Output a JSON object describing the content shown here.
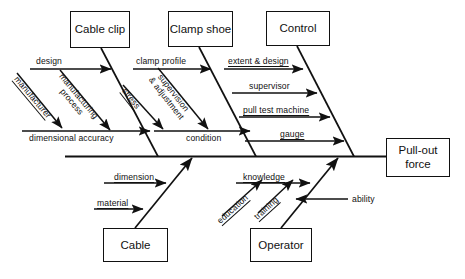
{
  "diagram": {
    "type": "fishbone-ishikawa",
    "title": "",
    "effect": {
      "label_line1": "Pull-out",
      "label_line2": "force",
      "full_label": "Pull-out force"
    },
    "categories": [
      {
        "name": "Cable clip",
        "position": "top",
        "causes": [
          {
            "label": "design",
            "orientation": "horizontal",
            "underlined": false
          },
          {
            "label": "manufacturer",
            "orientation": "diagonal",
            "underlined": true
          },
          {
            "label": "manufacturing",
            "label2": "process",
            "orientation": "diagonal",
            "underlined": true
          },
          {
            "label": "dimensional accuracy",
            "orientation": "horizontal",
            "underlined": false
          }
        ]
      },
      {
        "name": "Clamp shoe",
        "position": "top",
        "causes": [
          {
            "label": "clamp profile",
            "orientation": "horizontal",
            "underlined": false
          },
          {
            "label": "supervision",
            "label2": "& adjustment",
            "orientation": "diagonal",
            "underlined": true
          },
          {
            "label": "stress",
            "orientation": "diagonal",
            "underlined": true
          },
          {
            "label": "condition",
            "orientation": "horizontal",
            "underlined": false
          }
        ]
      },
      {
        "name": "Control",
        "position": "top",
        "causes": [
          {
            "label": "extent & design",
            "orientation": "horizontal",
            "underlined": true
          },
          {
            "label": "supervisor",
            "orientation": "horizontal",
            "underlined": false
          },
          {
            "label": "pull test machine",
            "orientation": "horizontal",
            "underlined": true
          },
          {
            "label": "gauge",
            "orientation": "horizontal",
            "underlined": true
          }
        ]
      },
      {
        "name": "Cable",
        "position": "bottom",
        "causes": [
          {
            "label": "dimension",
            "orientation": "horizontal",
            "underlined": true
          },
          {
            "label": "material",
            "orientation": "horizontal",
            "underlined": true
          }
        ]
      },
      {
        "name": "Operator",
        "position": "bottom",
        "causes": [
          {
            "label": "knowledge",
            "orientation": "horizontal",
            "underlined": true
          },
          {
            "label": "education",
            "orientation": "diagonal",
            "underlined": true
          },
          {
            "label": "training",
            "orientation": "diagonal",
            "underlined": true
          },
          {
            "label": "ability",
            "orientation": "horizontal",
            "underlined": false
          }
        ]
      }
    ],
    "colors": {
      "line": "#111111",
      "box_border": "#111111",
      "background": "#ffffff",
      "text": "#111111"
    }
  }
}
